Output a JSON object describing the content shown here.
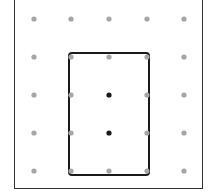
{
  "geoboard": {
    "rows": 5,
    "cols": 5,
    "peg_color": "#a6a6a6",
    "highlight_color": "#1a1a1a",
    "xs": [
      34,
      71,
      109,
      147,
      184
    ],
    "ys": [
      19,
      57,
      95,
      133,
      171
    ],
    "highlighted_pegs": [
      [
        2,
        2
      ],
      [
        2,
        3
      ]
    ],
    "rectangle": {
      "from_peg": [
        1,
        1
      ],
      "to_peg": [
        3,
        4
      ],
      "stroke": "#1a1a1a"
    }
  }
}
